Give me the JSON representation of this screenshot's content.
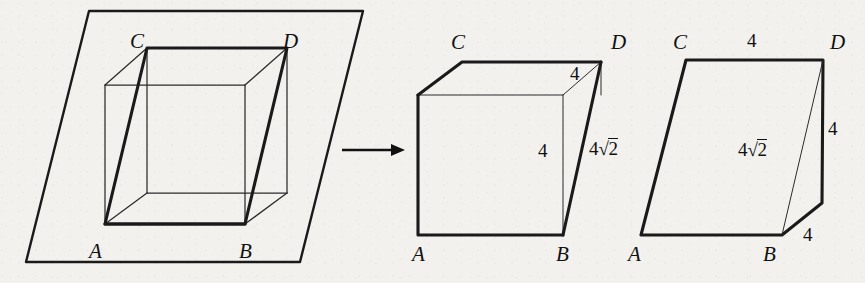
{
  "figure": {
    "kind": "geometry-diagram",
    "background_color": "#f2f1ee",
    "ink_color": "#1a1a1a",
    "panels": [
      {
        "id": "panel-left",
        "name": "cube-in-plane",
        "labels": [
          {
            "id": "left-C",
            "text": "C",
            "kind": "vertex",
            "x": 130,
            "y": 31
          },
          {
            "id": "left-D",
            "text": "D",
            "kind": "vertex",
            "x": 283,
            "y": 31
          },
          {
            "id": "left-A",
            "text": "A",
            "kind": "vertex",
            "x": 89,
            "y": 241
          },
          {
            "id": "left-B",
            "text": "B",
            "kind": "vertex",
            "x": 239,
            "y": 241
          }
        ]
      },
      {
        "id": "panel-arrow",
        "name": "transformation-arrow",
        "labels": []
      },
      {
        "id": "panel-middle",
        "name": "cube-with-face-diagonal",
        "labels": [
          {
            "id": "mid-C",
            "text": "C",
            "kind": "vertex",
            "x": 451,
            "y": 32
          },
          {
            "id": "mid-D",
            "text": "D",
            "kind": "vertex",
            "x": 611,
            "y": 32
          },
          {
            "id": "mid-A",
            "text": "A",
            "kind": "vertex",
            "x": 412,
            "y": 244
          },
          {
            "id": "mid-B",
            "text": "B",
            "kind": "vertex",
            "x": 556,
            "y": 244
          },
          {
            "id": "mid-top-4",
            "text": "4",
            "kind": "measure",
            "x": 570,
            "y": 64
          },
          {
            "id": "mid-side-4",
            "text": "4",
            "kind": "measure",
            "x": 538,
            "y": 141
          },
          {
            "id": "mid-diag",
            "text": "4√2",
            "kind": "measure-radical",
            "coef": "4",
            "radicand": "2",
            "x": 589,
            "y": 138
          }
        ]
      },
      {
        "id": "panel-right",
        "name": "unfolded-net",
        "labels": [
          {
            "id": "rgt-C",
            "text": "C",
            "kind": "vertex",
            "x": 673,
            "y": 32
          },
          {
            "id": "rgt-D",
            "text": "D",
            "kind": "vertex",
            "x": 830,
            "y": 32
          },
          {
            "id": "rgt-A",
            "text": "A",
            "kind": "vertex",
            "x": 628,
            "y": 244
          },
          {
            "id": "rgt-B",
            "text": "B",
            "kind": "vertex",
            "x": 763,
            "y": 244
          },
          {
            "id": "rgt-top-4",
            "text": "4",
            "kind": "measure",
            "x": 747,
            "y": 31
          },
          {
            "id": "rgt-right-4",
            "text": "4",
            "kind": "measure",
            "x": 828,
            "y": 119
          },
          {
            "id": "rgt-bot-4",
            "text": "4",
            "kind": "measure",
            "x": 803,
            "y": 225
          },
          {
            "id": "rgt-diag",
            "text": "4√2",
            "kind": "measure-radical",
            "coef": "4",
            "radicand": "2",
            "x": 738,
            "y": 139
          }
        ]
      }
    ]
  },
  "geometry": {
    "left": {
      "plane": "89,11 363,11 300,262 26,262",
      "cube_back_top": "147,48 287,48",
      "cube_thick_path": "105,224 147,48 287,48 245,224 105,224",
      "cube_back_left": "147,48 147,193",
      "cube_back_right": "287,48 287,193",
      "cube_back_bottom": "147,193 287,193",
      "cube_front_top": "105,85 245,85",
      "cube_front_left": "105,85 105,224",
      "cube_front_right": "245,85 245,224",
      "cube_front_bottom": "105,224 245,224",
      "edge_tl": "105,85 147,48",
      "edge_tr": "245,85 287,48",
      "edge_bl": "105,224 147,193",
      "edge_br": "245,224 287,193"
    },
    "arrow": {
      "line": "342,150 396,150",
      "head": "404,150 392,144.5 392,155.5"
    },
    "middle": {
      "front_face": "418,95 563,95 563,235 418,235",
      "top_face": "418,95 462,62 601,62 563,95",
      "right_thick": "601,62 563,235",
      "right_edge_down": "601,62 601,95",
      "small_diag": "563,95 601,62"
    },
    "right": {
      "outline": "641,235 686,60 823,60 822,203 782,235",
      "diag": "823,60 782,235",
      "bottom_flap": "782,235 822,203"
    }
  }
}
